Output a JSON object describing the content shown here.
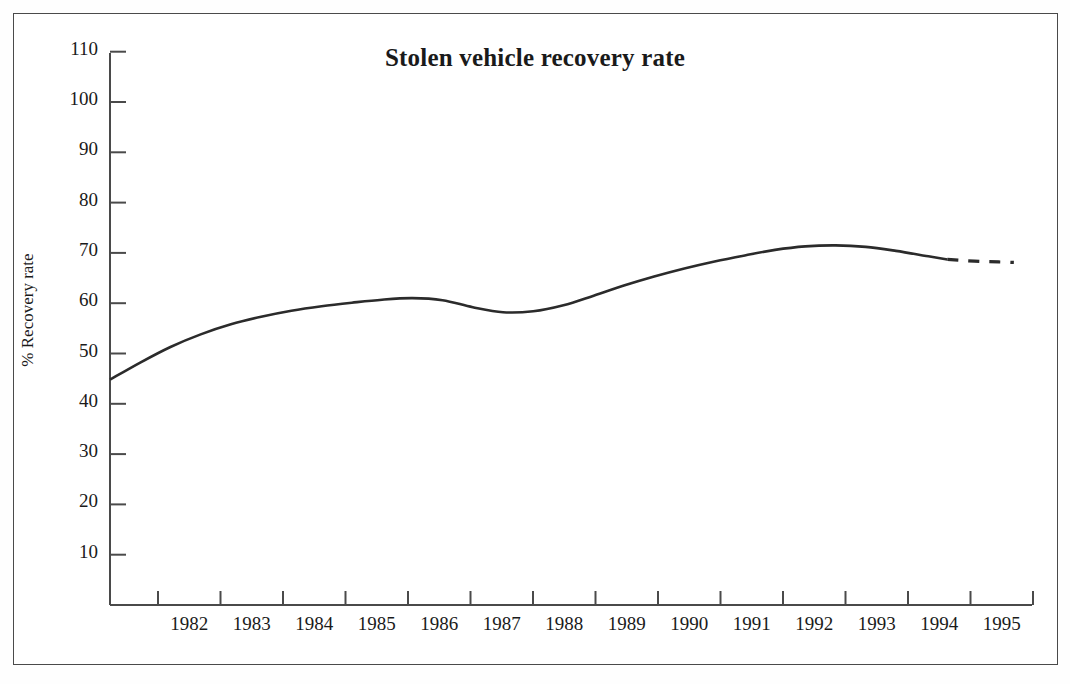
{
  "chart_data": {
    "type": "line",
    "title": "Stolen vehicle recovery rate",
    "xlabel": "",
    "ylabel": "% Recovery rate",
    "ylim": [
      0,
      115
    ],
    "xlim": [
      1981.25,
      1996.5
    ],
    "grid": false,
    "legend": null,
    "y_ticks": [
      10,
      20,
      30,
      40,
      50,
      60,
      70,
      80,
      90,
      100,
      110
    ],
    "y_tick_labels": [
      "10",
      "20",
      "30",
      "40",
      "50",
      "60",
      "70",
      "80",
      "90",
      "100",
      "110"
    ],
    "x_tick_labels": [
      "1982",
      "1983",
      "1984",
      "1985",
      "1986",
      "1987",
      "1988",
      "1989",
      "1990",
      "1991",
      "1992",
      "1993",
      "1994",
      "1995"
    ],
    "series": [
      {
        "name": "Recovery rate (observed)",
        "style": "solid",
        "x": [
          1981.25,
          1981.75,
          1982.25,
          1982.75,
          1983.25,
          1983.75,
          1984.25,
          1984.75,
          1985.25,
          1985.75,
          1986.25,
          1986.75,
          1987.25,
          1987.75,
          1988.25,
          1988.75,
          1989.25,
          1989.75,
          1990.25,
          1990.75,
          1991.25,
          1991.75,
          1992.25,
          1992.75,
          1993.25,
          1993.75,
          1994.25,
          1994.75,
          1995.1
        ],
        "values": [
          44.8,
          48.2,
          51.3,
          53.8,
          55.8,
          57.3,
          58.5,
          59.4,
          60.1,
          60.7,
          61.0,
          60.6,
          59.2,
          58.2,
          58.4,
          59.6,
          61.5,
          63.5,
          65.3,
          66.9,
          68.3,
          69.5,
          70.6,
          71.3,
          71.5,
          71.2,
          70.4,
          69.4,
          68.7
        ]
      },
      {
        "name": "Recovery rate (projected)",
        "style": "dashed",
        "x": [
          1995.1,
          1995.35,
          1995.65,
          1995.95,
          1996.2
        ],
        "values": [
          68.7,
          68.5,
          68.3,
          68.2,
          68.1
        ]
      }
    ],
    "annotations": []
  },
  "colors": {
    "line": "#2b2b2b",
    "axis": "#4a4a4a",
    "text": "#1a1a1a",
    "background": "#ffffff",
    "frame": "#4a4a4a"
  }
}
